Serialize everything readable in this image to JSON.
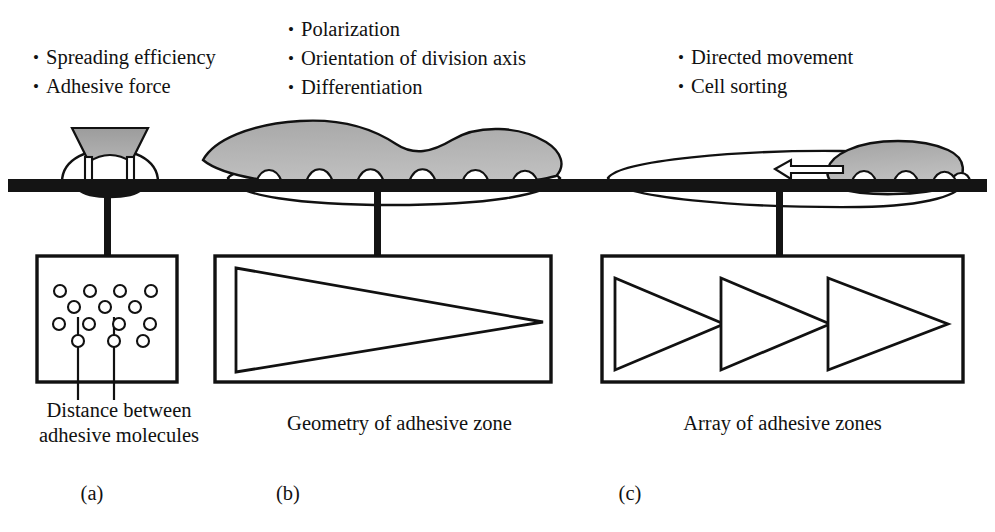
{
  "figure": {
    "columns": [
      {
        "id": "a",
        "panel_label": "(a)",
        "caption_line1": "Distance between",
        "caption_line2": "adhesive molecules",
        "bullets": [
          "Spreading efficiency",
          "Adhesive force"
        ],
        "schematic": "lattice-of-adhesive-molecules",
        "cell_state": "rounded-poorly-spread-cell"
      },
      {
        "id": "b",
        "panel_label": "(b)",
        "caption_line1": "Geometry of adhesive zone",
        "caption_line2": "",
        "bullets": [
          "Polarization",
          "Orientation of division axis",
          "Differentiation"
        ],
        "schematic": "single-large-triangle",
        "cell_state": "well-spread-flattened-cell"
      },
      {
        "id": "c",
        "panel_label": "(c)",
        "caption_line1": "Array of adhesive zones",
        "caption_line2": "",
        "bullets": [
          "Directed movement",
          "Cell sorting"
        ],
        "schematic": "array-of-three-triangles",
        "cell_state": "migrating-polarized-cell"
      }
    ],
    "bullet_marker": "•",
    "colors": {
      "substrate": "#141414",
      "outline": "#111111",
      "cell_body_gray": "#9a9a9a",
      "cell_body_light_gray": "#c9c9c9",
      "cell_cytoplasm": "#ffffff",
      "background": "#ffffff"
    },
    "schematic_counts": {
      "adhesive_molecule_circles": 15,
      "triangles_in_array": 3,
      "leader_lines": 2,
      "focal_adhesions_spread_cell": 6,
      "focal_adhesions_migrating_cell": 3,
      "attachment_feet_rounded_cell": 2
    },
    "movement_arrow": {
      "direction": "left",
      "style": "hollow-outline"
    }
  }
}
